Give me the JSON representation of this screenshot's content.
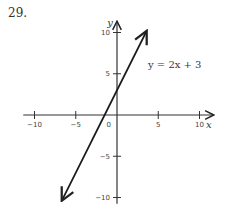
{
  "problem_number": "29.",
  "chart_data": {
    "type": "line",
    "title": "",
    "equation_label": "y = 2x + 3",
    "xlabel": "x",
    "ylabel": "y",
    "xlim": [
      -11,
      11
    ],
    "ylim": [
      -11,
      11
    ],
    "x_ticks": [
      -10,
      -5,
      5,
      10
    ],
    "y_ticks": [
      10,
      5,
      -5,
      -10
    ],
    "x_tick_labels": [
      "−10",
      "−5",
      "5",
      "10"
    ],
    "y_tick_labels": [
      "10",
      "5",
      "−5",
      "−10"
    ],
    "origin_label": "0",
    "grid": false,
    "series": [
      {
        "name": "y = 2x + 3",
        "slope": 2,
        "intercept": 3,
        "x": [
          -6.7,
          3.6
        ],
        "y": [
          -10.4,
          10.2
        ],
        "arrows_both_ends": true
      }
    ]
  }
}
